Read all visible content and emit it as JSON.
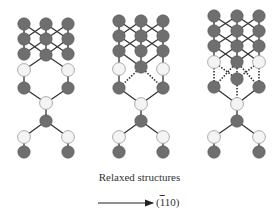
{
  "caption": "Relaxed structures",
  "direction": {
    "open": "(",
    "barred_digit": "1",
    "rest": "10)",
    "full": "(Š1̄ 10)"
  },
  "colors": {
    "atom_dark": "#6f6f6f",
    "atom_light": "#f4f4f4",
    "atom_stroke": "#555555",
    "bond": "#333333",
    "text": "#333333"
  },
  "structures": [
    {
      "id": "structure-1",
      "bond_type_interface": "solid",
      "dark_atoms": [
        [
          24,
          24
        ],
        [
          46,
          24
        ],
        [
          68,
          24
        ],
        [
          24,
          39
        ],
        [
          46,
          39
        ],
        [
          68,
          39
        ],
        [
          24,
          54
        ],
        [
          46,
          55
        ],
        [
          68,
          54
        ],
        [
          24,
          88
        ],
        [
          68,
          88
        ],
        [
          46,
          121
        ],
        [
          24,
          152
        ],
        [
          68,
          152
        ]
      ],
      "light_atoms": [
        [
          24,
          70
        ],
        [
          68,
          70
        ],
        [
          46,
          103
        ],
        [
          24,
          137
        ],
        [
          68,
          137
        ]
      ],
      "solid_bonds": [
        [
          24,
          24,
          46,
          39
        ],
        [
          46,
          24,
          24,
          39
        ],
        [
          46,
          24,
          68,
          39
        ],
        [
          68,
          24,
          46,
          39
        ],
        [
          24,
          39,
          46,
          55
        ],
        [
          46,
          39,
          24,
          54
        ],
        [
          46,
          39,
          68,
          54
        ],
        [
          68,
          39,
          46,
          55
        ],
        [
          24,
          24,
          24,
          54
        ],
        [
          46,
          24,
          46,
          55
        ],
        [
          68,
          24,
          68,
          54
        ],
        [
          46,
          55,
          24,
          70
        ],
        [
          46,
          55,
          68,
          70
        ],
        [
          24,
          70,
          24,
          88
        ],
        [
          68,
          70,
          68,
          88
        ],
        [
          24,
          88,
          46,
          103
        ],
        [
          68,
          88,
          46,
          103
        ],
        [
          46,
          103,
          46,
          121
        ],
        [
          46,
          121,
          24,
          137
        ],
        [
          46,
          121,
          68,
          137
        ],
        [
          24,
          137,
          24,
          152
        ],
        [
          68,
          137,
          68,
          152
        ]
      ],
      "dashed_bonds": []
    },
    {
      "id": "structure-2",
      "bond_type_interface": "dashed",
      "dark_atoms": [
        [
          119,
          21
        ],
        [
          141,
          21
        ],
        [
          163,
          21
        ],
        [
          119,
          36
        ],
        [
          141,
          36
        ],
        [
          163,
          36
        ],
        [
          119,
          51
        ],
        [
          141,
          51
        ],
        [
          163,
          51
        ],
        [
          141,
          67
        ],
        [
          119,
          88
        ],
        [
          163,
          88
        ],
        [
          141,
          121
        ],
        [
          119,
          152
        ],
        [
          163,
          152
        ]
      ],
      "light_atoms": [
        [
          119,
          69
        ],
        [
          163,
          69
        ],
        [
          141,
          104
        ],
        [
          119,
          137
        ],
        [
          163,
          137
        ]
      ],
      "solid_bonds": [
        [
          119,
          21,
          141,
          36
        ],
        [
          141,
          21,
          119,
          36
        ],
        [
          141,
          21,
          163,
          36
        ],
        [
          163,
          21,
          141,
          36
        ],
        [
          119,
          36,
          141,
          51
        ],
        [
          141,
          36,
          119,
          51
        ],
        [
          141,
          36,
          163,
          51
        ],
        [
          163,
          36,
          141,
          51
        ],
        [
          119,
          51,
          141,
          67
        ],
        [
          163,
          51,
          141,
          67
        ],
        [
          119,
          21,
          119,
          51
        ],
        [
          141,
          21,
          141,
          67
        ],
        [
          163,
          21,
          163,
          51
        ],
        [
          119,
          51,
          119,
          69
        ],
        [
          163,
          51,
          163,
          69
        ],
        [
          119,
          69,
          119,
          88
        ],
        [
          163,
          69,
          163,
          88
        ],
        [
          119,
          88,
          141,
          104
        ],
        [
          163,
          88,
          141,
          104
        ],
        [
          141,
          104,
          141,
          121
        ],
        [
          141,
          121,
          119,
          137
        ],
        [
          141,
          121,
          163,
          137
        ],
        [
          119,
          137,
          119,
          152
        ],
        [
          163,
          137,
          163,
          152
        ]
      ],
      "dashed_bonds": [
        [
          141,
          67,
          119,
          88
        ],
        [
          141,
          67,
          163,
          88
        ]
      ]
    },
    {
      "id": "structure-3",
      "bond_type_interface": "dashed",
      "dark_atoms": [
        [
          214,
          16
        ],
        [
          237,
          16
        ],
        [
          259,
          16
        ],
        [
          214,
          31
        ],
        [
          237,
          31
        ],
        [
          259,
          31
        ],
        [
          214,
          46
        ],
        [
          237,
          46
        ],
        [
          259,
          46
        ],
        [
          237,
          62
        ],
        [
          237,
          79
        ],
        [
          214,
          87
        ],
        [
          259,
          87
        ],
        [
          237,
          121
        ],
        [
          214,
          152
        ],
        [
          259,
          152
        ]
      ],
      "light_atoms": [
        [
          214,
          62
        ],
        [
          259,
          62
        ],
        [
          237,
          104
        ],
        [
          214,
          137
        ],
        [
          259,
          137
        ]
      ],
      "solid_bonds": [
        [
          214,
          16,
          237,
          31
        ],
        [
          237,
          16,
          214,
          31
        ],
        [
          237,
          16,
          259,
          31
        ],
        [
          259,
          16,
          237,
          31
        ],
        [
          214,
          31,
          237,
          46
        ],
        [
          237,
          31,
          214,
          46
        ],
        [
          237,
          31,
          259,
          46
        ],
        [
          259,
          31,
          237,
          46
        ],
        [
          214,
          46,
          237,
          62
        ],
        [
          237,
          46,
          214,
          62
        ],
        [
          237,
          46,
          259,
          62
        ],
        [
          259,
          46,
          237,
          62
        ],
        [
          214,
          16,
          214,
          62
        ],
        [
          237,
          16,
          237,
          62
        ],
        [
          259,
          16,
          259,
          62
        ],
        [
          214,
          87,
          237,
          104
        ],
        [
          259,
          87,
          237,
          104
        ],
        [
          237,
          104,
          237,
          121
        ],
        [
          237,
          121,
          214,
          137
        ],
        [
          237,
          121,
          259,
          137
        ],
        [
          214,
          137,
          214,
          152
        ],
        [
          259,
          137,
          259,
          152
        ]
      ],
      "dashed_bonds": [
        [
          214,
          62,
          214,
          87
        ],
        [
          259,
          62,
          259,
          87
        ],
        [
          237,
          62,
          214,
          87
        ],
        [
          237,
          62,
          259,
          87
        ],
        [
          237,
          62,
          237,
          79
        ],
        [
          237,
          79,
          237,
          104
        ],
        [
          214,
          62,
          237,
          79
        ],
        [
          259,
          62,
          237,
          79
        ]
      ]
    }
  ],
  "arrow": {
    "x1": 98,
    "y1": 203,
    "x2": 153,
    "y2": 203
  }
}
